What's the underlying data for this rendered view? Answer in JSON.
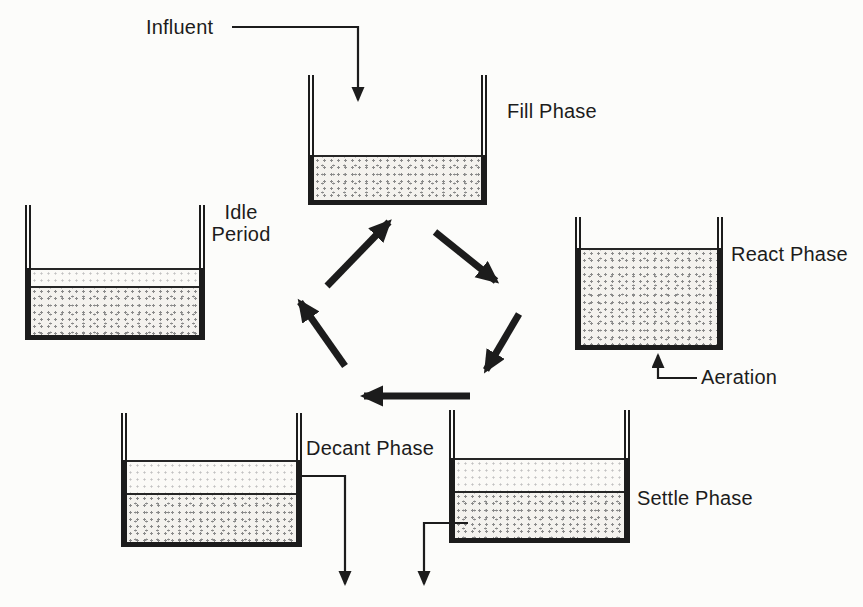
{
  "labels": {
    "influent": "Influent",
    "fill_phase": "Fill Phase",
    "react_phase": "React Phase",
    "aeration": "Aeration",
    "settle_phase": "Settle Phase",
    "decant_phase": "Decant Phase",
    "idle_period": "Idle Period"
  },
  "colors": {
    "ink": "#1c1c1c",
    "background": "#fcfcfa",
    "mixed_liquor_bg": "#f4f2ee",
    "mixed_liquor_dot": "#8a8a8a",
    "supernatant_bg": "#fbfaf7",
    "supernatant_dot": "#c2c2c2"
  }
}
